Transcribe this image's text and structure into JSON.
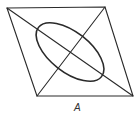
{
  "figure": {
    "label": "A",
    "colors": {
      "line": "#2a2a2a",
      "label": "#333333",
      "background": "#ffffff"
    }
  }
}
